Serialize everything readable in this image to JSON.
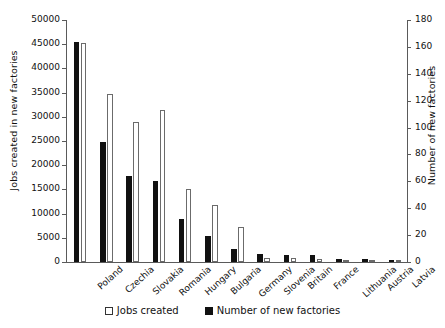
{
  "chart_data": {
    "type": "bar",
    "title": "",
    "categories": [
      "Poland",
      "Czechia",
      "Slovakia",
      "Romania",
      "Hungary",
      "Bulgaria",
      "Germany",
      "Slovenia",
      "Britain",
      "France",
      "Lithuania",
      "Austria",
      "Latvia"
    ],
    "series": [
      {
        "name": "Jobs created",
        "axis": "left",
        "style": "white-outline",
        "values": [
          45300,
          34700,
          29000,
          31500,
          15100,
          11700,
          7300,
          800,
          900,
          700,
          400,
          200,
          200
        ]
      },
      {
        "name": "Number of new factories",
        "axis": "right",
        "style": "black-fill",
        "values": [
          164,
          89,
          64,
          60,
          32,
          19,
          10,
          6,
          5,
          5,
          2,
          2,
          1
        ]
      }
    ],
    "left_axis": {
      "label": "Jobs created  in new factories",
      "ylim": [
        0,
        50000
      ],
      "ticks": [
        0,
        5000,
        10000,
        15000,
        20000,
        25000,
        30000,
        35000,
        40000,
        45000,
        50000
      ],
      "ticklabels": [
        "0",
        "5000",
        "10000",
        "15000",
        "20000",
        "25000",
        "30000",
        "35000",
        "40000",
        "45000",
        "50000"
      ]
    },
    "right_axis": {
      "label": "Number of new factories",
      "ylim": [
        0,
        180
      ],
      "ticks": [
        0,
        20,
        40,
        60,
        80,
        100,
        120,
        140,
        160,
        180
      ],
      "ticklabels": [
        "0",
        "20",
        "40",
        "60",
        "80",
        "100",
        "120",
        "140",
        "160",
        "180"
      ]
    },
    "grid": false,
    "legend": {
      "position": "bottom",
      "entries": [
        {
          "label": "Jobs created",
          "swatch": "white-outline"
        },
        {
          "label": "Number of new factories",
          "swatch": "black-fill"
        }
      ]
    },
    "colors": {
      "jobs_created": "#ffffff",
      "jobs_created_border": "#6b6b6b",
      "number_of_new_factories": "#111111",
      "axis": "#5a5a5a",
      "text": "#111111"
    }
  }
}
